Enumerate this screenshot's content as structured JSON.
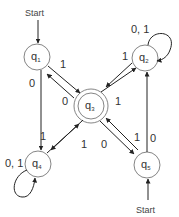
{
  "diagram": {
    "type": "finite-automaton",
    "states": [
      {
        "id": "q1",
        "name": "q",
        "sub": "1",
        "start": true,
        "accept": false
      },
      {
        "id": "q2",
        "name": "q",
        "sub": "2",
        "start": false,
        "accept": false
      },
      {
        "id": "q3",
        "name": "q",
        "sub": "3",
        "start": false,
        "accept": true
      },
      {
        "id": "q4",
        "name": "q",
        "sub": "4",
        "start": false,
        "accept": false
      },
      {
        "id": "q5",
        "name": "q",
        "sub": "5",
        "start": true,
        "accept": false
      }
    ],
    "start_label_q1": "Start",
    "start_label_q5": "Start",
    "transitions": [
      {
        "from": "q1",
        "to": "q3",
        "label": "1"
      },
      {
        "from": "q3",
        "to": "q1",
        "label": "0"
      },
      {
        "from": "q1",
        "to": "q4",
        "label": "0"
      },
      {
        "from": "q3",
        "to": "q2",
        "label": "1"
      },
      {
        "from": "q2",
        "to": "q3",
        "label": "1"
      },
      {
        "from": "q2",
        "to": "q2",
        "label": "0, 1"
      },
      {
        "from": "q4",
        "to": "q3",
        "label": "1"
      },
      {
        "from": "q3",
        "to": "q4",
        "label": "1"
      },
      {
        "from": "q4",
        "to": "q4",
        "label": "0, 1"
      },
      {
        "from": "q3",
        "to": "q5",
        "label": "0"
      },
      {
        "from": "q5",
        "to": "q3",
        "label": "1"
      },
      {
        "from": "q5",
        "to": "q2",
        "label": "0"
      }
    ]
  }
}
